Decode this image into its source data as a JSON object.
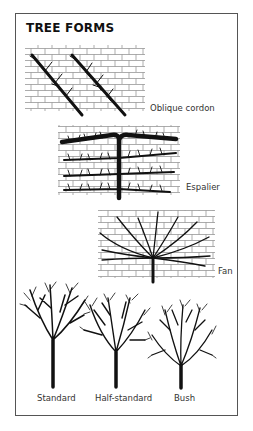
{
  "title": "TREE FORMS",
  "forms": [
    {
      "id": "oblique-cordon",
      "label": "Oblique cordon",
      "trained_on_wall": true
    },
    {
      "id": "espalier",
      "label": "Espalier",
      "trained_on_wall": true
    },
    {
      "id": "fan",
      "label": "Fan",
      "trained_on_wall": true
    },
    {
      "id": "standard",
      "label": "Standard",
      "trained_on_wall": false
    },
    {
      "id": "half-standard",
      "label": "Half-standard",
      "trained_on_wall": false
    },
    {
      "id": "bush",
      "label": "Bush",
      "trained_on_wall": false
    }
  ],
  "colors": {
    "ink": "#111111",
    "brick": "#888888",
    "frame": "#555555"
  }
}
